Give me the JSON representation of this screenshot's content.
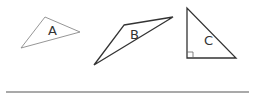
{
  "diagram": {
    "triangles": [
      {
        "label": "A",
        "points": "45,17 80,32 21,48",
        "label_pos": [
          48,
          35
        ],
        "stroke": "#8a8a8a",
        "stroke_width": 0.9
      },
      {
        "label": "B",
        "points": "124,25 173,17 94,65",
        "label_pos": [
          130,
          39
        ],
        "stroke": "#333333",
        "stroke_width": 1.3
      },
      {
        "label": "C",
        "points": "187,8 187,58 236,58",
        "label_pos": [
          204,
          45
        ],
        "stroke": "#333333",
        "stroke_width": 1.3,
        "right_angle_marker": true
      }
    ],
    "baseline": {
      "x1": 6,
      "y1": 92,
      "x2": 249,
      "y2": 92,
      "stroke": "#555555"
    }
  }
}
